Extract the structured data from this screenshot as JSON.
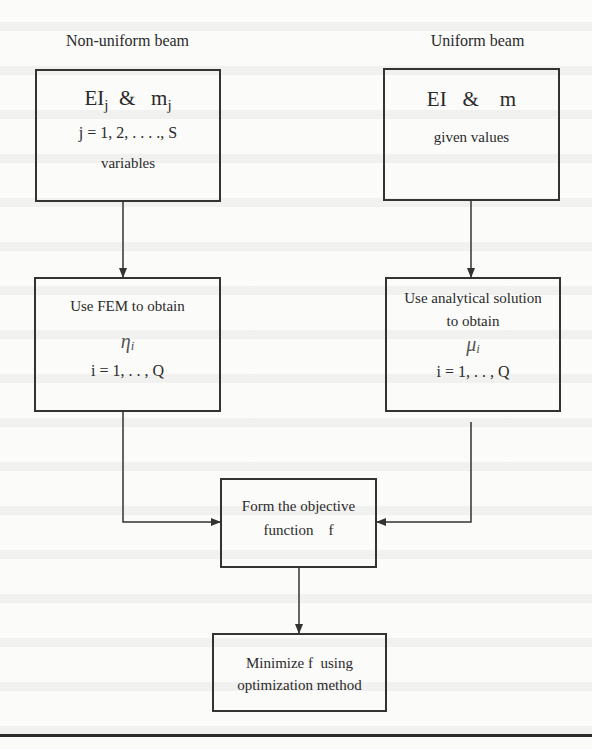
{
  "diagram": {
    "left_column": {
      "title": "Non-uniform beam",
      "input_box": {
        "symbol_main_1": "EI",
        "symbol_sub_1": "j",
        "amp": "&",
        "symbol_main_2": "m",
        "symbol_sub_2": "j",
        "index_range": "j = 1, 2, . . . ., S",
        "note": "variables"
      },
      "process_box": {
        "line1": "Use FEM to obtain",
        "greek": "η",
        "greek_sub": "i",
        "index_range": "i = 1, . . , Q"
      }
    },
    "right_column": {
      "title": "Uniform beam",
      "input_box": {
        "symbol_main_1": "EI",
        "amp": "&",
        "symbol_main_2": "m",
        "note": "given values"
      },
      "process_box": {
        "line1": "Use analytical solution",
        "line2": "to obtain",
        "greek": "μ",
        "greek_sub": "i",
        "index_range": "i = 1, . . , Q"
      }
    },
    "objective_box": {
      "line1": "Form the objective",
      "line2": "function    f"
    },
    "minimize_box": {
      "line1": "Minimize f  using",
      "line2": "optimization method"
    },
    "line_color": "#333333",
    "edges": [
      {
        "from": "left-input",
        "to": "left-process"
      },
      {
        "from": "right-input",
        "to": "right-process"
      },
      {
        "from": "left-process",
        "to": "objective"
      },
      {
        "from": "right-process",
        "to": "objective"
      },
      {
        "from": "objective",
        "to": "minimize"
      }
    ]
  }
}
